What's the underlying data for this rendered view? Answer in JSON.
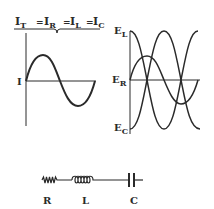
{
  "title": {
    "parts": [
      {
        "main": "I",
        "sub": "T"
      },
      {
        "main": "I",
        "sub": "R"
      },
      {
        "main": "I",
        "sub": "L"
      },
      {
        "main": "I",
        "sub": "C"
      }
    ],
    "separator": "="
  },
  "current_graph": {
    "axis_label": "I",
    "waveform": "sine"
  },
  "voltage_graph": {
    "labels": {
      "top": {
        "main": "E",
        "sub": "L"
      },
      "middle": {
        "main": "E",
        "sub": "R"
      },
      "bottom": {
        "main": "E",
        "sub": "C"
      }
    },
    "waveforms": [
      "E_L (cosine, leads 90°)",
      "E_R (sine, in phase)",
      "E_C (negative cosine, lags 90°)"
    ]
  },
  "circuit": {
    "components": [
      {
        "symbol": "resistor",
        "label": "R"
      },
      {
        "symbol": "inductor",
        "label": "L"
      },
      {
        "symbol": "capacitor",
        "label": "C"
      }
    ]
  },
  "colors": {
    "ink": "#2a2a2a",
    "background": "#ffffff"
  }
}
